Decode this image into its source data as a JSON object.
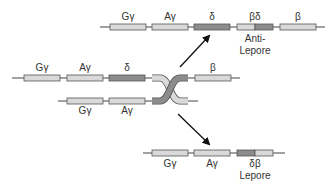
{
  "colors": {
    "light_gene": "#d9d9d9",
    "dark_gene": "#8c8c8c",
    "outline": "#555555",
    "line": "#444444",
    "text": "#333333"
  },
  "rows": {
    "top": {
      "genes": [
        {
          "label": "Gγ",
          "type": "light"
        },
        {
          "label": "Aγ",
          "type": "light"
        },
        {
          "label": "δ",
          "type": "dark"
        },
        {
          "label": "βδ",
          "type": "split-light-dark"
        },
        {
          "label": "β",
          "type": "light"
        }
      ],
      "caption": "Anti-Lepore",
      "caption_line1": "Anti-",
      "caption_line2": "Lepore"
    },
    "middle_upper": {
      "genes": [
        {
          "label": "Gγ",
          "type": "light"
        },
        {
          "label": "Aγ",
          "type": "light"
        },
        {
          "label": "δ",
          "type": "dark"
        },
        {
          "label": "β",
          "type": "light"
        }
      ]
    },
    "middle_lower": {
      "genes": [
        {
          "label": "Gγ",
          "type": "light"
        },
        {
          "label": "Aγ",
          "type": "light"
        }
      ]
    },
    "bottom": {
      "genes": [
        {
          "label": "Gγ",
          "type": "light"
        },
        {
          "label": "Aγ",
          "type": "light"
        },
        {
          "label": "δβ",
          "type": "split-dark-light"
        }
      ],
      "caption": "Lepore"
    }
  },
  "arrows": [
    {
      "name": "to-anti-lepore",
      "direction": "up-right"
    },
    {
      "name": "to-lepore",
      "direction": "down-right"
    }
  ],
  "icons": {
    "crossover": "unequal-crossing-over-icon",
    "arrow": "arrow-icon"
  }
}
